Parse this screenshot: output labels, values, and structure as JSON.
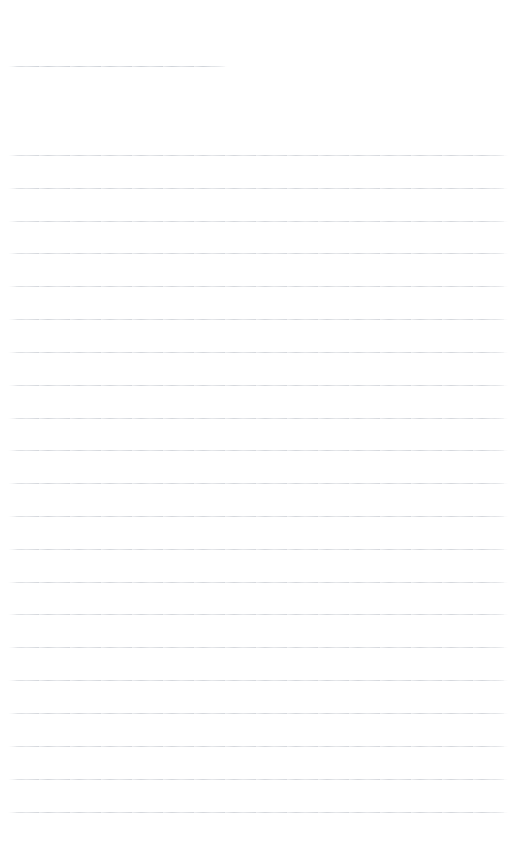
{
  "page": {
    "kind": "ruled-paper",
    "width": 525,
    "height": 865,
    "background_color": "#ffffff",
    "content_text": "",
    "note": "blank ruled sheet, no written content"
  },
  "ink": {
    "rule_color": "#d4d7dc",
    "header_rule_color": "#cfd3d9"
  },
  "header_rule": {
    "name": "title-underline",
    "y": 66,
    "x_start": 8,
    "x_end": 227,
    "length": 219,
    "thickness": 1
  },
  "ruling": {
    "line_count": 21,
    "x_start": 8,
    "x_end": 508,
    "line_length": 500,
    "spacing": 32.85,
    "first_line_y": 155,
    "last_line_y": 812,
    "thickness": 1,
    "lines": [
      {
        "index": 1,
        "y": 155
      },
      {
        "index": 2,
        "y": 188
      },
      {
        "index": 3,
        "y": 221
      },
      {
        "index": 4,
        "y": 253
      },
      {
        "index": 5,
        "y": 286
      },
      {
        "index": 6,
        "y": 319
      },
      {
        "index": 7,
        "y": 352
      },
      {
        "index": 8,
        "y": 385
      },
      {
        "index": 9,
        "y": 418
      },
      {
        "index": 10,
        "y": 450
      },
      {
        "index": 11,
        "y": 483
      },
      {
        "index": 12,
        "y": 516
      },
      {
        "index": 13,
        "y": 549
      },
      {
        "index": 14,
        "y": 582
      },
      {
        "index": 15,
        "y": 614
      },
      {
        "index": 16,
        "y": 647
      },
      {
        "index": 17,
        "y": 680
      },
      {
        "index": 18,
        "y": 713
      },
      {
        "index": 19,
        "y": 746
      },
      {
        "index": 20,
        "y": 779
      },
      {
        "index": 21,
        "y": 812
      }
    ]
  },
  "margins": {
    "top_blank_height": 55,
    "gap_after_header_rule": 88,
    "bottom_blank_height": 52
  }
}
